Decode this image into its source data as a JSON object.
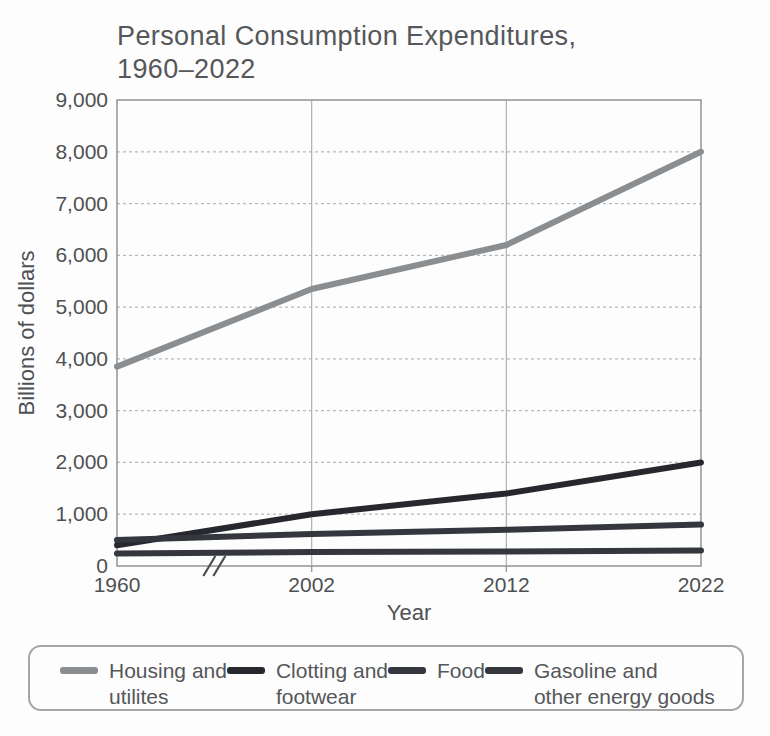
{
  "title": {
    "line1": "Personal Consumption Expenditures,",
    "line2": "1960–2022"
  },
  "chart_data": {
    "type": "line",
    "title": "Personal Consumption Expenditures, 1960–2022",
    "x_categories": [
      "1960",
      "2002",
      "2012",
      "2022"
    ],
    "xlabel": "Year",
    "ylabel": "Billions of dollars",
    "ylim": [
      0,
      9000
    ],
    "y_tick_step": 1000,
    "grid": true,
    "legend_position": "bottom",
    "axis_break": {
      "between": [
        "1960",
        "2002"
      ],
      "fraction": 0.5
    },
    "series": [
      {
        "name": "Housing and utilites",
        "color": "#8b8e91",
        "values": [
          3850,
          5350,
          6200,
          8000
        ]
      },
      {
        "name": "Clotting and footwear",
        "color": "#26282e",
        "values": [
          400,
          1000,
          1400,
          2000
        ]
      },
      {
        "name": "Food",
        "color": "#34373d",
        "values": [
          500,
          620,
          700,
          800
        ]
      },
      {
        "name": "Gasoline and other energy goods",
        "color": "#34373d",
        "values": [
          240,
          270,
          280,
          300
        ]
      }
    ]
  },
  "legend": {
    "items": [
      {
        "name": "Housing and utilites",
        "lines": [
          "Housing and",
          "utilites"
        ],
        "color": "#8b8e91"
      },
      {
        "name": "Clotting and footwear",
        "lines": [
          "Clotting and",
          "footwear"
        ],
        "color": "#26282e"
      },
      {
        "name": "Food",
        "lines": [
          "Food"
        ],
        "color": "#34373d"
      },
      {
        "name": "Gasoline and other energy goods",
        "lines": [
          "Gasoline and",
          "other energy goods"
        ],
        "color": "#34373d"
      }
    ]
  },
  "style": {
    "grid_color": "#b6b8ba",
    "border_color": "#97999c",
    "tick_text_color": "#4e5053",
    "break_mark_color": "#4b4d50"
  }
}
